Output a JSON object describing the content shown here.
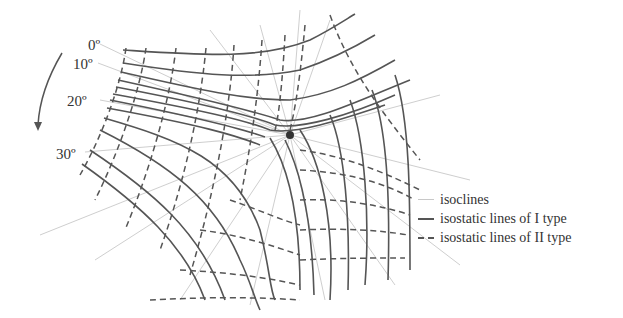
{
  "diagram": {
    "title": "",
    "angle_labels": [
      "0º",
      "10º",
      "20º",
      "30º"
    ],
    "rotation_arrow": "counter-clockwise arrow",
    "singular_point": "isotropic point",
    "legend": [
      {
        "key": "isoclines",
        "label": "isoclines",
        "style": "thin light gray solid"
      },
      {
        "key": "type1",
        "label": "isostatic lines of I type",
        "style": "dark solid"
      },
      {
        "key": "type2",
        "label": "isostatic lines of II type",
        "style": "dark dashed"
      }
    ],
    "colors": {
      "isoclines": "#c8c8c8",
      "isostatic": "#555555"
    }
  }
}
